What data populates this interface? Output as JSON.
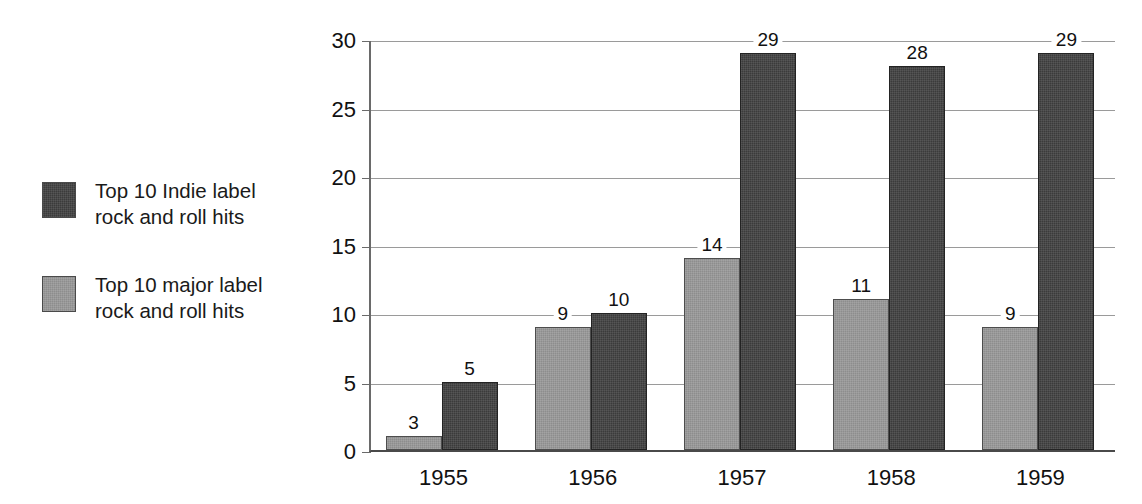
{
  "legend": {
    "items": [
      {
        "swatch": "dark",
        "label": "Top 10 Indie label\nrock and roll hits",
        "color": "#3b3b3b"
      },
      {
        "swatch": "gray",
        "label": "Top 10 major label\nrock and roll hits",
        "color": "#8d8d8d"
      }
    ]
  },
  "chart_data": {
    "type": "bar",
    "title": "",
    "xlabel": "",
    "ylabel": "",
    "categories": [
      "1955",
      "1956",
      "1957",
      "1958",
      "1959"
    ],
    "series": [
      {
        "name": "Top 10 major label rock and roll hits",
        "color": "#8d8d8d",
        "values": [
          3,
          9,
          14,
          11,
          9
        ],
        "plotted": [
          1,
          9,
          14,
          11,
          9
        ]
      },
      {
        "name": "Top 10 Indie label rock and roll hits",
        "color": "#3b3b3b",
        "values": [
          5,
          10,
          29,
          28,
          29
        ],
        "plotted": [
          5,
          10,
          29,
          28,
          29
        ]
      }
    ],
    "ylim": [
      0,
      30
    ],
    "yticks": [
      0,
      5,
      10,
      15,
      20,
      25,
      30
    ],
    "ytick_labels": [
      "0",
      "5",
      "10",
      "15",
      "20",
      "25",
      "30"
    ],
    "grid": true,
    "legend_position": "left-outside"
  }
}
